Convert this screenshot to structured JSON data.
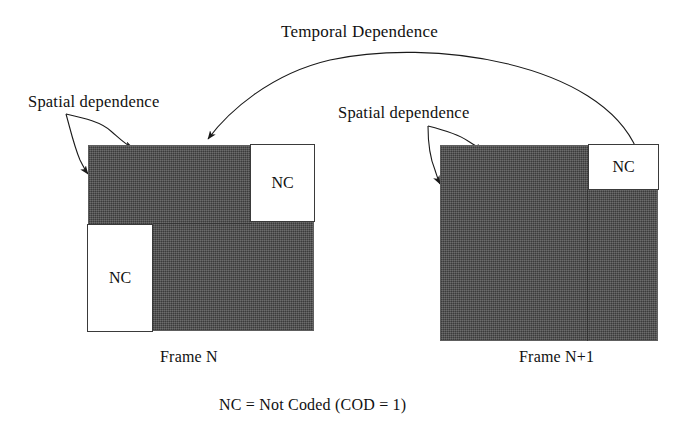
{
  "figure": {
    "type": "diagram",
    "legend": "NC = Not Coded (COD = 1)"
  },
  "annotations": {
    "temporal": "Temporal Dependence",
    "spatial_left": "Spatial dependence",
    "spatial_right": "Spatial dependence"
  },
  "frames": [
    {
      "caption": "Frame N",
      "fill_color": "#4a4a4a",
      "blocks": [
        {
          "label": "NC",
          "position": "top-right"
        },
        {
          "label": "NC",
          "position": "bottom-left"
        }
      ]
    },
    {
      "caption": "Frame N+1",
      "fill_color": "#4a4a4a",
      "blocks": [
        {
          "label": "NC",
          "position": "top-right"
        }
      ]
    }
  ],
  "colors": {
    "coded_block": "#4a4a4a",
    "not_coded_block": "#ffffff",
    "stroke": "#1a1a1a",
    "background": "#ffffff"
  }
}
